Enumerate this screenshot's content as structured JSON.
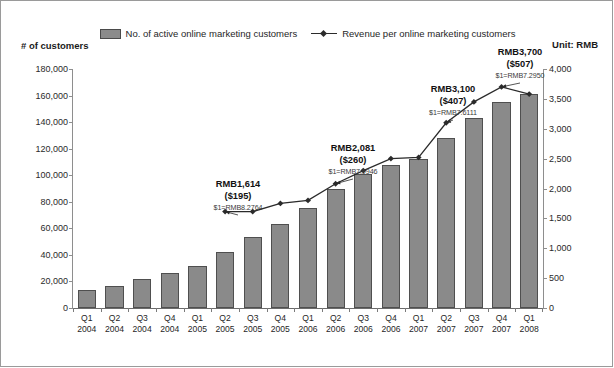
{
  "legend": {
    "bar_label": "No. of active online marketing customers",
    "line_label": "Revenue per online marketing customers",
    "bar_swatch_icon": "bar-swatch-icon",
    "line_swatch_icon": "line-marker-icon"
  },
  "axis_captions": {
    "left": "# of customers",
    "right": "Unit: RMB"
  },
  "chart_data": {
    "type": "bar",
    "title": "",
    "subtitle": "",
    "xlabel": "",
    "ylabel": "# of customers",
    "y2label": "Unit: RMB",
    "grid": false,
    "legend_position": "top-center",
    "categories": [
      "Q1 2004",
      "Q2 2004",
      "Q3 2004",
      "Q4 2004",
      "Q1 2005",
      "Q2 2005",
      "Q3 2005",
      "Q4 2005",
      "Q1 2006",
      "Q2 2006",
      "Q3 2006",
      "Q4 2006",
      "Q1 2007",
      "Q2 2007",
      "Q3 2007",
      "Q4 2007",
      "Q1 2008"
    ],
    "category_quarters": [
      "Q1",
      "Q2",
      "Q3",
      "Q4",
      "Q1",
      "Q2",
      "Q3",
      "Q4",
      "Q1",
      "Q2",
      "Q3",
      "Q4",
      "Q1",
      "Q2",
      "Q3",
      "Q4",
      "Q1"
    ],
    "category_years": [
      "2004",
      "2004",
      "2004",
      "2004",
      "2005",
      "2005",
      "2005",
      "2005",
      "2006",
      "2006",
      "2006",
      "2006",
      "2007",
      "2007",
      "2007",
      "2007",
      "2008"
    ],
    "ylim": [
      0,
      180000
    ],
    "yticks": [
      0,
      20000,
      40000,
      60000,
      80000,
      100000,
      120000,
      140000,
      160000,
      180000
    ],
    "ytick_labels": [
      "0",
      "20,000",
      "40,000",
      "60,000",
      "80,000",
      "100,000",
      "120,000",
      "140,000",
      "160,000",
      "180,000"
    ],
    "y2lim": [
      0,
      4000
    ],
    "y2ticks": [
      0,
      500,
      1000,
      1500,
      2000,
      2500,
      3000,
      3500,
      4000
    ],
    "y2tick_labels": [
      "0",
      "500",
      "1,000",
      "1,500",
      "2,000",
      "2,500",
      "3,000",
      "3,500",
      "4,000"
    ],
    "series": [
      {
        "name": "No. of active online marketing customers",
        "type": "bar",
        "axis": "left",
        "color": "#8a8a8a",
        "values": [
          13500,
          16500,
          21500,
          26500,
          32000,
          42000,
          53500,
          63000,
          75000,
          90000,
          101000,
          107500,
          112000,
          128000,
          143000,
          155000,
          161000
        ]
      },
      {
        "name": "Revenue per online marketing customers",
        "type": "line",
        "axis": "right",
        "color": "#2b2b2b",
        "values": [
          null,
          null,
          null,
          null,
          null,
          1614,
          1614,
          1750,
          1800,
          2081,
          2300,
          2500,
          2520,
          3100,
          3450,
          3700,
          3580
        ]
      }
    ],
    "annotations": [
      {
        "category": "Q2 2005",
        "value_rmb": "RMB1,614",
        "value_usd": "($195)",
        "fx_rate": "$1=RMB8.2764"
      },
      {
        "category": "Q2 2006",
        "value_rmb": "RMB2,081",
        "value_usd": "($260)",
        "fx_rate": "$1=RMB7.9946"
      },
      {
        "category": "Q2 2007",
        "value_rmb": "RMB3,100",
        "value_usd": "($407)",
        "fx_rate": "$1=RMB7.6111"
      },
      {
        "category": "Q4 2007",
        "value_rmb": "RMB3,700",
        "value_usd": "($507)",
        "fx_rate": "$1=RMB7.2950"
      }
    ]
  },
  "colors": {
    "bar_fill": "#8a8a8a",
    "bar_stroke": "#4f4f4f",
    "line": "#2b2b2b",
    "axis": "#8e8e8e",
    "frame": "#9a9a9a",
    "text": "#1a1a1a"
  }
}
